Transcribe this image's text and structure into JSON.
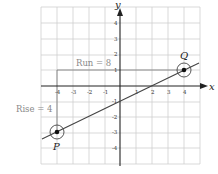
{
  "diagram": {
    "x_axis_label": "x",
    "y_axis_label": "y",
    "x_ticks": [
      "-4",
      "-3",
      "-2",
      "-1",
      "1",
      "2",
      "3",
      "4"
    ],
    "y_ticks": [
      "4",
      "3",
      "2",
      "1",
      "-1",
      "-2",
      "-3",
      "-4"
    ],
    "points": [
      {
        "label": "P",
        "x": -4,
        "y": -3
      },
      {
        "label": "Q",
        "x": 4,
        "y": 1
      }
    ],
    "run_label": "Run = 8",
    "rise_label": "Rise = 4",
    "line_equation": "y = x/2 - 1",
    "colors": {
      "grid": "#cfcfcf",
      "axis": "#222222",
      "line": "#444444",
      "annotation": "#8a8a8a"
    }
  }
}
